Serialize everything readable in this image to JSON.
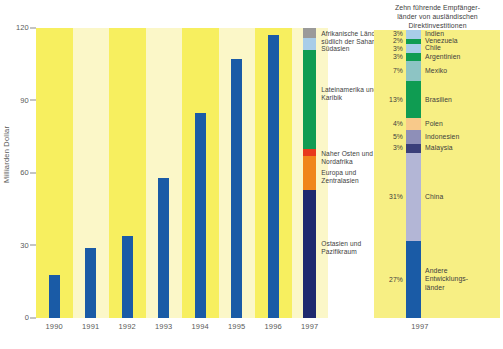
{
  "chart_data": {
    "type": "bar",
    "title": "",
    "xlabel": "",
    "ylabel": "Milliarden Dollar",
    "ylim": [
      0,
      120
    ],
    "yticks": [
      0,
      30,
      60,
      90,
      120
    ],
    "ytick_labels": [
      "0",
      "30",
      "60",
      "90",
      "120"
    ],
    "grid": false,
    "categories": [
      "1990",
      "1991",
      "1992",
      "1993",
      "1994",
      "1995",
      "1996",
      "1997"
    ],
    "values": [
      18,
      29,
      34,
      58,
      85,
      107,
      117,
      120
    ],
    "series": [
      {
        "name": "Ausländische Direktinvestitionen",
        "values": [
          18,
          29,
          34,
          58,
          85,
          107,
          117,
          120
        ]
      }
    ],
    "stacked_bar": {
      "category": "1997",
      "total": 120,
      "segments": [
        {
          "label": "Afrikanische Länder\nsüdlich der Sahara",
          "value": 4,
          "color": "#9a9a9a"
        },
        {
          "label": "Südasien",
          "value": 5,
          "color": "#a8cde8"
        },
        {
          "label": "Lateinamerika und\nKaribik",
          "value": 41,
          "color": "#0f9c52"
        },
        {
          "label": "Naher Osten und\nNordafrika",
          "value": 3,
          "color": "#e8391b"
        },
        {
          "label": "Europa und\nZentralasien",
          "value": 14,
          "color": "#f0851a"
        },
        {
          "label": "Ostasien und\nPazifikraum",
          "value": 53,
          "color": "#1f2a6e"
        }
      ]
    },
    "legend_chart": {
      "title": "Zehn führende Empfänger-\nländer von ausländischen\nDirektinvestitionen",
      "category": "1997",
      "segments": [
        {
          "pct": "3%",
          "name": "Indien",
          "value": 3,
          "color": "#a8cde8"
        },
        {
          "pct": "2%",
          "name": "Venezuela",
          "value": 2,
          "color": "#0f9c52"
        },
        {
          "pct": "3%",
          "name": "Chile",
          "value": 3,
          "color": "#a8cde8"
        },
        {
          "pct": "3%",
          "name": "Argentinien",
          "value": 3,
          "color": "#0f9c52"
        },
        {
          "pct": "7%",
          "name": "Mexiko",
          "value": 7,
          "color": "#8dc4c4"
        },
        {
          "pct": "13%",
          "name": "Brasilien",
          "value": 13,
          "color": "#0f9c52"
        },
        {
          "pct": "4%",
          "name": "Polen",
          "value": 4,
          "color": "#f8c98a"
        },
        {
          "pct": "5%",
          "name": "Indonesien",
          "value": 5,
          "color": "#8e8fb8"
        },
        {
          "pct": "3%",
          "name": "Malaysia",
          "value": 3,
          "color": "#3a3f7a"
        },
        {
          "pct": "31%",
          "name": "China",
          "value": 31,
          "color": "#b3b6d6"
        },
        {
          "pct": "27%",
          "name": "Andere\nEntwicklungs-\nländer",
          "value": 27,
          "color": "#1a5ba6"
        }
      ]
    },
    "colors": {
      "bar": "#1a5ba6",
      "stripe_light": "#fbf7c8",
      "stripe_dark": "#f7ef5f",
      "legend_bg": "#f7ef84",
      "text": "#4a4a4a"
    }
  }
}
